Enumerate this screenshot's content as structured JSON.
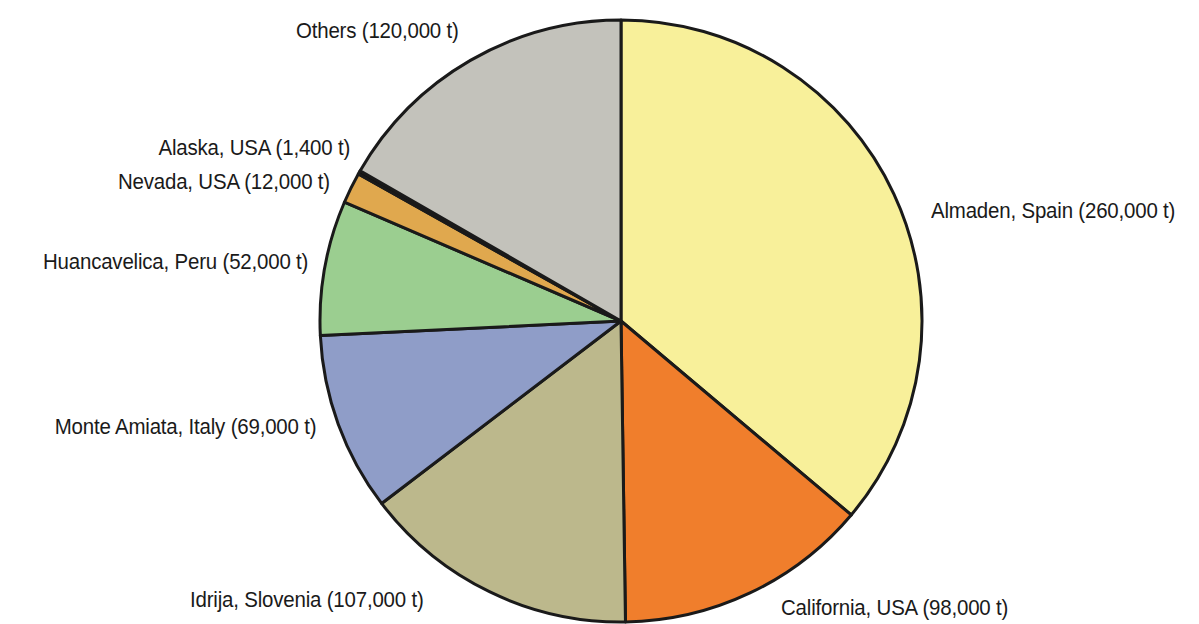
{
  "figure": {
    "background_color": "#ffffff",
    "outline_color": "#1a1a1a"
  },
  "chart_data": {
    "type": "pie",
    "title": "",
    "subtitle": "",
    "xlabel": "",
    "ylabel": "",
    "units": "t",
    "total": 719400,
    "legend_position": "callout-labels",
    "start_angle_deg": 0,
    "direction": "clockwise",
    "categories": [
      "Almaden, Spain",
      "California, USA",
      "Idrija, Slovenia",
      "Monte Amiata, Italy",
      "Huancavelica, Peru",
      "Nevada, USA",
      "Alaska, USA",
      "Others"
    ],
    "values": [
      260000,
      98000,
      107000,
      69000,
      52000,
      12000,
      1400,
      120000
    ],
    "slices": [
      {
        "label": "Almaden, Spain (260,000 t)",
        "name": "Almaden, Spain",
        "value": 260000,
        "value_text": "260,000 t",
        "color": "#f8f09a",
        "start_deg": 0,
        "sweep_deg": 130.11,
        "percent": 36.1
      },
      {
        "label": "California, USA (98,000 t)",
        "name": "California, USA",
        "value": 98000,
        "value_text": "98,000 t",
        "color": "#f07e2c",
        "start_deg": 130.11,
        "sweep_deg": 49.04,
        "percent": 13.6
      },
      {
        "label": "Idrija, Slovenia (107,000 t)",
        "name": "Idrija, Slovenia",
        "value": 107000,
        "value_text": "107,000 t",
        "color": "#bcb88c",
        "start_deg": 179.15,
        "sweep_deg": 53.54,
        "percent": 14.9
      },
      {
        "label": "Monte Amiata, Italy (69,000 t)",
        "name": "Monte Amiata, Italy",
        "value": 69000,
        "value_text": "69,000 t",
        "color": "#8f9dc8",
        "start_deg": 232.69,
        "sweep_deg": 34.53,
        "percent": 9.6
      },
      {
        "label": "Huancavelica, Peru (52,000 t)",
        "name": "Huancavelica, Peru",
        "value": 52000,
        "value_text": "52,000 t",
        "color": "#9bce90",
        "start_deg": 267.22,
        "sweep_deg": 26.02,
        "percent": 7.2
      },
      {
        "label": "Nevada, USA (12,000 t)",
        "name": "Nevada, USA",
        "value": 12000,
        "value_text": "12,000 t",
        "color": "#e0a84e",
        "start_deg": 293.24,
        "sweep_deg": 6.0,
        "percent": 1.7
      },
      {
        "label": "Alaska, USA (1,400 t)",
        "name": "Alaska, USA",
        "value": 1400,
        "value_text": "1,400 t",
        "color": "#111111",
        "start_deg": 299.24,
        "sweep_deg": 0.7,
        "percent": 0.2
      },
      {
        "label": "Others (120,000 t)",
        "name": "Others",
        "value": 120000,
        "value_text": "120,000 t",
        "color": "#c3c2bb",
        "start_deg": 299.94,
        "sweep_deg": 60.06,
        "percent": 16.7
      }
    ]
  },
  "labels": {
    "almaden": "Almaden, Spain (260,000 t)",
    "california": "California, USA (98,000 t)",
    "idrija": "Idrija, Slovenia (107,000 t)",
    "monte_amiata": "Monte Amiata, Italy (69,000 t)",
    "huancavelica": "Huancavelica, Peru (52,000 t)",
    "nevada": "Nevada, USA (12,000 t)",
    "alaska": "Alaska, USA (1,400 t)",
    "others": "Others (120,000 t)"
  }
}
